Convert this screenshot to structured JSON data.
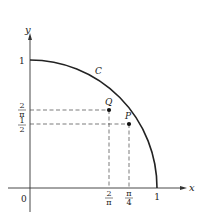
{
  "diagram": {
    "axes": {
      "x_label": "x",
      "y_label": "y",
      "origin_label": "0"
    },
    "curve": {
      "label": "C",
      "description": "quarter of unit circle from (0,1) to (1,0)"
    },
    "x_ticks": [
      {
        "num": "2",
        "den": "π",
        "value": 0.6366
      },
      {
        "num": "π",
        "den": "4",
        "value": 0.7854
      },
      {
        "label": "1",
        "value": 1
      }
    ],
    "y_ticks": [
      {
        "label": "1",
        "value": 1
      },
      {
        "num": "2",
        "den": "π",
        "value": 0.6366
      },
      {
        "num": "1",
        "den": "2",
        "value": 0.5
      }
    ],
    "points": [
      {
        "label": "Q",
        "x": "2/π",
        "y": "2/π"
      },
      {
        "label": "P",
        "x": "π/4",
        "y": "1/2"
      }
    ],
    "colors": {
      "ink": "#222222",
      "background": "#ffffff"
    }
  }
}
